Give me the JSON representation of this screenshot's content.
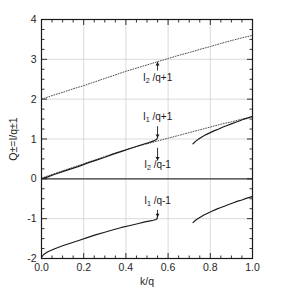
{
  "chart_data": {
    "type": "line",
    "title": "",
    "xlabel": "k/q",
    "ylabel": "Q±=I/q±1",
    "xlim": [
      0.0,
      1.0
    ],
    "ylim": [
      -2.0,
      4.0
    ],
    "grid": true,
    "xticks": [
      0.0,
      0.2,
      0.4,
      0.6,
      0.8,
      1.0
    ],
    "xticklabels": [
      "0.0",
      "0.2",
      "0.4",
      "0.6",
      "0.8",
      "1.0"
    ],
    "yticks": [
      -2,
      -1,
      0,
      1,
      2,
      3,
      4
    ],
    "yticklabels": [
      "-2",
      "-1",
      "0",
      "1",
      "2",
      "3",
      "4"
    ],
    "xminor_step": 0.05,
    "yminor_step": 0.25,
    "legend": "none",
    "annotations": [
      {
        "id": "annot-i2-q-plus-1",
        "text": "I2 /q+1",
        "base": "I",
        "sub": "2",
        "tail": " /q+1",
        "x": 0.55,
        "y": 2.45,
        "arrow_from_y": 2.72,
        "arrow_to_y": 2.93,
        "arrow_dir": "up"
      },
      {
        "id": "annot-i1-q-plus-1",
        "text": "I1 /q+1",
        "base": "I",
        "sub": "1",
        "tail": " /q+1",
        "x": 0.55,
        "y": 1.47,
        "arrow_from_y": 1.32,
        "arrow_to_y": 1.03,
        "arrow_dir": "down"
      },
      {
        "id": "annot-i2-q-minus-1",
        "text": "I2 /q-1",
        "base": "I",
        "sub": "2",
        "tail": " /q-1",
        "x": 0.55,
        "y": 0.27,
        "arrow_from_y": 0.78,
        "arrow_to_y": 0.46,
        "arrow_dir": "down"
      },
      {
        "id": "annot-i1-q-minus-1",
        "text": "I1 /q-1",
        "base": "I",
        "sub": "1",
        "tail": " /q-1",
        "x": 0.55,
        "y": -0.62,
        "arrow_from_y": -0.78,
        "arrow_to_y": -0.96,
        "arrow_dir": "down"
      }
    ],
    "series": [
      {
        "name": "I2/q+1",
        "style": "dotted",
        "color": "#555555",
        "points": [
          [
            0.0,
            2.0
          ],
          [
            0.05,
            2.09
          ],
          [
            0.1,
            2.17
          ],
          [
            0.15,
            2.26
          ],
          [
            0.2,
            2.34
          ],
          [
            0.25,
            2.43
          ],
          [
            0.3,
            2.52
          ],
          [
            0.35,
            2.61
          ],
          [
            0.4,
            2.7
          ],
          [
            0.45,
            2.78
          ],
          [
            0.5,
            2.86
          ],
          [
            0.55,
            2.94
          ],
          [
            0.6,
            3.02
          ],
          [
            0.65,
            3.1
          ],
          [
            0.7,
            3.17
          ],
          [
            0.75,
            3.25
          ],
          [
            0.8,
            3.32
          ],
          [
            0.85,
            3.4
          ],
          [
            0.9,
            3.47
          ],
          [
            0.95,
            3.54
          ],
          [
            1.0,
            3.6
          ]
        ]
      },
      {
        "name": "I2/q-1 (upper branch, dotted)",
        "style": "dotted",
        "color": "#555555",
        "points": [
          [
            0.0,
            0.02
          ],
          [
            0.05,
            0.11
          ],
          [
            0.1,
            0.2
          ],
          [
            0.15,
            0.29
          ],
          [
            0.2,
            0.38
          ],
          [
            0.25,
            0.47
          ],
          [
            0.3,
            0.56
          ],
          [
            0.35,
            0.65
          ],
          [
            0.4,
            0.73
          ],
          [
            0.45,
            0.81
          ],
          [
            0.5,
            0.88
          ],
          [
            0.55,
            0.95
          ],
          [
            0.6,
            1.02
          ],
          [
            0.65,
            1.09
          ],
          [
            0.7,
            1.16
          ],
          [
            0.75,
            1.23
          ],
          [
            0.8,
            1.3
          ],
          [
            0.85,
            1.37
          ],
          [
            0.9,
            1.43
          ],
          [
            0.95,
            1.5
          ],
          [
            1.0,
            1.56
          ]
        ]
      },
      {
        "name": "I1/q+1 (solid, left branch)",
        "style": "solid",
        "color": "#1a1a1a",
        "points": [
          [
            0.0,
            0.0
          ],
          [
            0.03,
            0.05
          ],
          [
            0.06,
            0.11
          ],
          [
            0.1,
            0.18
          ],
          [
            0.14,
            0.25
          ],
          [
            0.18,
            0.32
          ],
          [
            0.22,
            0.4
          ],
          [
            0.26,
            0.47
          ],
          [
            0.3,
            0.54
          ],
          [
            0.34,
            0.62
          ],
          [
            0.38,
            0.69
          ],
          [
            0.42,
            0.76
          ],
          [
            0.46,
            0.83
          ],
          [
            0.49,
            0.88
          ],
          [
            0.51,
            0.91
          ],
          [
            0.525,
            0.94
          ],
          [
            0.535,
            0.96
          ],
          [
            0.542,
            0.98
          ],
          [
            0.547,
            1.0
          ],
          [
            0.55,
            1.04
          ]
        ]
      },
      {
        "name": "I1/q+1 (solid, right branch)",
        "style": "solid",
        "color": "#1a1a1a",
        "points": [
          [
            0.718,
            0.88
          ],
          [
            0.73,
            0.94
          ],
          [
            0.745,
            1.0
          ],
          [
            0.76,
            1.05
          ],
          [
            0.78,
            1.11
          ],
          [
            0.8,
            1.16
          ],
          [
            0.82,
            1.21
          ],
          [
            0.84,
            1.25
          ],
          [
            0.86,
            1.3
          ],
          [
            0.88,
            1.34
          ],
          [
            0.9,
            1.38
          ],
          [
            0.92,
            1.42
          ],
          [
            0.94,
            1.46
          ],
          [
            0.96,
            1.5
          ],
          [
            0.98,
            1.53
          ],
          [
            1.0,
            1.57
          ]
        ]
      },
      {
        "name": "I2/q-1 (flat zero line)",
        "style": "solid",
        "color": "#3a3a3a",
        "points": [
          [
            0.0,
            0.0
          ],
          [
            0.25,
            0.0
          ],
          [
            0.5,
            0.0
          ],
          [
            0.75,
            0.0
          ],
          [
            1.0,
            0.0
          ]
        ]
      },
      {
        "name": "I1/q-1 (solid, left branch)",
        "style": "solid",
        "color": "#1a1a1a",
        "points": [
          [
            0.0,
            -1.97
          ],
          [
            0.01,
            -1.9
          ],
          [
            0.03,
            -1.83
          ],
          [
            0.06,
            -1.76
          ],
          [
            0.1,
            -1.68
          ],
          [
            0.14,
            -1.61
          ],
          [
            0.18,
            -1.54
          ],
          [
            0.22,
            -1.47
          ],
          [
            0.26,
            -1.4
          ],
          [
            0.3,
            -1.34
          ],
          [
            0.34,
            -1.28
          ],
          [
            0.38,
            -1.22
          ],
          [
            0.42,
            -1.17
          ],
          [
            0.46,
            -1.12
          ],
          [
            0.49,
            -1.08
          ],
          [
            0.51,
            -1.06
          ],
          [
            0.53,
            -1.04
          ],
          [
            0.542,
            -1.02
          ],
          [
            0.548,
            -1.0
          ],
          [
            0.551,
            -0.9
          ]
        ]
      },
      {
        "name": "I1/q-1 (solid, right branch)",
        "style": "solid",
        "color": "#1a1a1a",
        "points": [
          [
            0.718,
            -1.1
          ],
          [
            0.73,
            -1.04
          ],
          [
            0.75,
            -0.97
          ],
          [
            0.77,
            -0.91
          ],
          [
            0.79,
            -0.86
          ],
          [
            0.81,
            -0.81
          ],
          [
            0.83,
            -0.76
          ],
          [
            0.85,
            -0.72
          ],
          [
            0.87,
            -0.68
          ],
          [
            0.89,
            -0.64
          ],
          [
            0.91,
            -0.6
          ],
          [
            0.93,
            -0.56
          ],
          [
            0.95,
            -0.53
          ],
          [
            0.97,
            -0.49
          ],
          [
            0.99,
            -0.46
          ],
          [
            1.0,
            -0.44
          ]
        ]
      }
    ]
  }
}
